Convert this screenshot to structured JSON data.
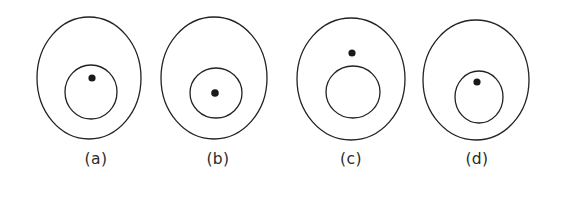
{
  "figure": {
    "background_color": "#ffffff",
    "stroke_color": "#222222",
    "dot_color": "#1a1a1a",
    "label_color": "#2b2b2b",
    "caption_row_y": 164,
    "panels": [
      {
        "id": "a",
        "label": "(a)",
        "label_x": 96,
        "label_y": 164,
        "outer": {
          "cx": 89,
          "cy": 78,
          "rx": 52,
          "ry": 61
        },
        "inner": {
          "cx": 91,
          "cy": 92,
          "rx": 26,
          "ry": 27
        },
        "dot": {
          "cx": 92,
          "cy": 78,
          "r": 3.6
        },
        "description": "dot inside small circle, offset above small circle center"
      },
      {
        "id": "b",
        "label": "(b)",
        "label_x": 218,
        "label_y": 164,
        "outer": {
          "cx": 214,
          "cy": 78,
          "rx": 53,
          "ry": 61
        },
        "inner": {
          "cx": 216,
          "cy": 93,
          "rx": 26,
          "ry": 25
        },
        "dot": {
          "cx": 215,
          "cy": 93,
          "r": 3.8
        },
        "description": "dot at center of small circle"
      },
      {
        "id": "c",
        "label": "(c)",
        "label_x": 351,
        "label_y": 164,
        "outer": {
          "cx": 351,
          "cy": 79,
          "rx": 54,
          "ry": 61
        },
        "inner": {
          "cx": 353,
          "cy": 92,
          "rx": 27,
          "ry": 26
        },
        "dot": {
          "cx": 352,
          "cy": 53,
          "r": 3.6
        },
        "description": "dot outside small circle, above it, still inside large circle"
      },
      {
        "id": "d",
        "label": "(d)",
        "label_x": 477,
        "label_y": 164,
        "outer": {
          "cx": 476,
          "cy": 80,
          "rx": 53,
          "ry": 60
        },
        "inner": {
          "cx": 479,
          "cy": 97,
          "rx": 24,
          "ry": 26
        },
        "dot": {
          "cx": 477,
          "cy": 82,
          "r": 3.6
        },
        "description": "dot inside small circle, slightly above small circle center"
      }
    ]
  }
}
